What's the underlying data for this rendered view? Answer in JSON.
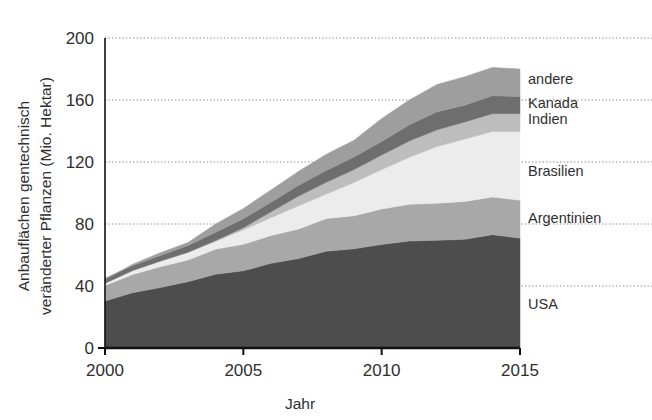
{
  "chart_data": {
    "type": "area",
    "stacked": true,
    "title": "",
    "xlabel": "Jahr",
    "ylabel": "Anbauflächen gentechnisch veränderter Pflanzen (Mio. Hektar)",
    "ylabel_line1": "Anbauflächen gentechnisch",
    "ylabel_line2": "veränderter Pflanzen (Mio. Hektar)",
    "xlim": [
      2000,
      2015
    ],
    "ylim": [
      0,
      200
    ],
    "yticks": [
      0,
      40,
      80,
      120,
      160,
      200
    ],
    "xticks": [
      2000,
      2005,
      2010,
      2015
    ],
    "grid": true,
    "grid_axis": "y",
    "legend_position": "right-inline",
    "x": [
      2000,
      2001,
      2002,
      2003,
      2004,
      2005,
      2006,
      2007,
      2008,
      2009,
      2010,
      2011,
      2012,
      2013,
      2014,
      2015
    ],
    "series": [
      {
        "name": "USA",
        "color": "#4d4d4d",
        "values": [
          30.3,
          35.7,
          39.0,
          42.8,
          47.6,
          49.8,
          54.6,
          57.7,
          62.5,
          64.0,
          66.8,
          69.0,
          69.5,
          70.1,
          73.1,
          70.9
        ]
      },
      {
        "name": "Argentinien",
        "color": "#a8a8a8",
        "values": [
          10.0,
          11.8,
          13.5,
          13.9,
          16.2,
          17.1,
          18.0,
          19.1,
          21.0,
          21.3,
          22.9,
          23.7,
          23.9,
          24.4,
          24.3,
          24.5
        ]
      },
      {
        "name": "Brasilien",
        "color": "#ececec",
        "values": [
          1.5,
          2.5,
          3.5,
          5.0,
          5.0,
          9.4,
          11.5,
          15.0,
          15.8,
          21.4,
          25.4,
          30.3,
          36.6,
          40.3,
          42.2,
          44.2
        ]
      },
      {
        "name": "Indien",
        "color": "#bdbdbd",
        "values": [
          0.0,
          0.0,
          0.1,
          0.1,
          0.5,
          1.3,
          3.8,
          6.2,
          7.6,
          8.4,
          9.4,
          10.6,
          10.8,
          11.0,
          11.6,
          11.6
        ]
      },
      {
        "name": "Kanada",
        "color": "#6e6e6e",
        "values": [
          3.0,
          3.2,
          3.5,
          4.4,
          5.4,
          5.8,
          6.1,
          7.0,
          7.6,
          8.2,
          8.8,
          10.4,
          11.6,
          10.8,
          11.6,
          11.0
        ]
      },
      {
        "name": "andere",
        "color": "#9e9e9e",
        "values": [
          -0.7,
          0.9,
          1.9,
          1.9,
          5.3,
          6.6,
          8.0,
          9.0,
          10.5,
          10.7,
          14.7,
          16.0,
          17.6,
          18.4,
          18.2,
          17.8
        ]
      }
    ],
    "totals": [
      44.1,
      54.1,
      61.5,
      68.1,
      80.0,
      90.0,
      102.0,
      114.0,
      125.0,
      134.0,
      148.0,
      160.0,
      170.0,
      175.0,
      181.0,
      180.0
    ]
  },
  "legend": [
    {
      "label": "andere"
    },
    {
      "label": "Kanada"
    },
    {
      "label": "Indien"
    },
    {
      "label": "Brasilien"
    },
    {
      "label": "Argentinien"
    },
    {
      "label": "USA"
    }
  ]
}
